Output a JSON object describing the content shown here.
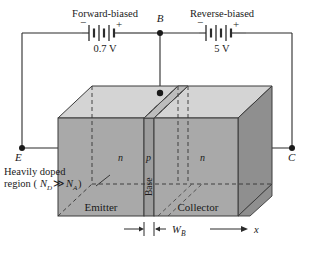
{
  "figure": {
    "type": "npn-bjt-biasing-diagram",
    "title_left": "Forward-biased",
    "title_right": "Reverse-biased",
    "source_left_value": "0.7 V",
    "source_right_value": "5 V",
    "polarity_minus": "−",
    "polarity_plus": "+"
  },
  "terminals": {
    "emitter": "E",
    "base": "B",
    "collector": "C"
  },
  "regions": {
    "left_layer": "n",
    "middle_layer": "p",
    "right_layer": "n",
    "base_side_label": "Base",
    "emitter_label": "Emitter",
    "collector_label": "Collector"
  },
  "annotations": {
    "doping_line1": "Heavily doped",
    "doping_line2_prefix": "region (",
    "doping_nd": "N",
    "doping_nd_sub": "D",
    "doping_gg": " ≫ ",
    "doping_na": "N",
    "doping_na_sub": "A",
    "doping_line2_suffix": ")",
    "base_width": "W",
    "base_width_sub": "B",
    "axis_label": "x"
  },
  "colors": {
    "top_face": "#d2d2d2",
    "front_face": "#a8a8a8",
    "right_face": "#8f8f8f",
    "base_face": "#9e9e9e",
    "outline": "#3a3a3a",
    "wire": "#2b2b2b",
    "text": "#1a1a1a"
  }
}
